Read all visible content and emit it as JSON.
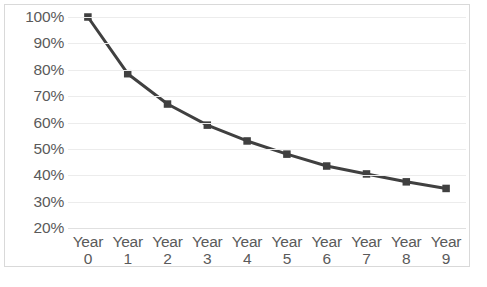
{
  "chart_data": {
    "type": "line",
    "title": "",
    "xlabel": "",
    "ylabel": "",
    "categories": [
      "Year 0",
      "Year 1",
      "Year 2",
      "Year 3",
      "Year 4",
      "Year 5",
      "Year 6",
      "Year 7",
      "Year 8",
      "Year 9"
    ],
    "category_names": [
      "Year",
      "Year",
      "Year",
      "Year",
      "Year",
      "Year",
      "Year",
      "Year",
      "Year",
      "Year"
    ],
    "category_values": [
      "0",
      "1",
      "2",
      "3",
      "4",
      "5",
      "6",
      "7",
      "8",
      "9"
    ],
    "values": [
      100,
      78.5,
      67,
      59,
      53,
      48,
      43.5,
      40.5,
      37.5,
      35
    ],
    "value_labels": [
      "100%",
      "78.5%",
      "67%",
      "59%",
      "53%",
      "48%",
      "43.5%",
      "40.5%",
      "37.5%",
      "35%"
    ],
    "ylim": [
      20,
      100
    ],
    "ytick_values": [
      100,
      90,
      80,
      70,
      60,
      50,
      40,
      30,
      20
    ],
    "ytick_labels": [
      "100%",
      "90%",
      "80%",
      "70%",
      "60%",
      "50%",
      "40%",
      "30%",
      "20%"
    ],
    "grid": true,
    "legend": false,
    "series_color": "#404040",
    "gridline_color": "#ececec",
    "border_color": "#d9d9d9",
    "tick_label_color": "#5a5a5a",
    "marker": "square"
  }
}
